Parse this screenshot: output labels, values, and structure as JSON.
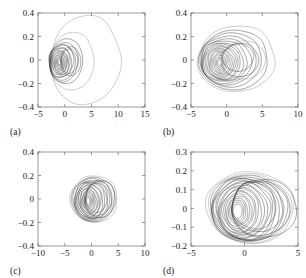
{
  "figure": {
    "type": "multi-panel-phase-portrait",
    "panels": 4,
    "layout": "2x2",
    "background_color": "#ffffff",
    "line_color": "#2b2b2b",
    "axis_color": "#6e6e6e"
  },
  "panels": {
    "a": {
      "label": "(a)",
      "xticklabels": [
        "-5",
        "0",
        "5",
        "10",
        "15"
      ],
      "yticklabels": [
        "0.4",
        "0.2",
        "0",
        "-0.2",
        "-0.4"
      ]
    },
    "b": {
      "label": "(b)",
      "xticklabels": [
        "-5",
        "0",
        "5",
        "10"
      ],
      "yticklabels": [
        "0.4",
        "0.2",
        "0",
        "-0.2",
        "-0.4"
      ]
    },
    "c": {
      "label": "(c)",
      "xticklabels": [
        "-10",
        "-5",
        "0",
        "5",
        "10"
      ],
      "yticklabels": [
        "0.4",
        "0.2",
        "0",
        "-0.2",
        "-0.4"
      ]
    },
    "d": {
      "label": "(d)",
      "xticklabels": [
        "-5",
        "0",
        "5"
      ],
      "yticklabels": [
        "0.3",
        "0.2",
        "0.1",
        "0",
        "-0.1",
        "-0.2"
      ]
    }
  },
  "chart_data": [
    {
      "panel": "a",
      "type": "line",
      "title": "",
      "xlabel": "",
      "ylabel": "",
      "xlim": [
        -5,
        15
      ],
      "ylim": [
        -0.4,
        0.4
      ],
      "xticks": [
        -5,
        0,
        5,
        10,
        15
      ],
      "yticks": [
        -0.4,
        -0.2,
        0,
        0.2,
        0.4
      ],
      "grid": false,
      "legend": "none",
      "description": "Nested quasi-periodic closed orbits; one large outer loop extends to x = 10.4 and y from -0.38 to 0.37, with a dense cluster of smaller loops centred near x = -0.6.",
      "orbits": [
        {
          "cx": 3.9,
          "cy": 0.0,
          "rx": 6.5,
          "ry": 0.375,
          "rot": 0,
          "shape": "ellipse",
          "style": "faint"
        },
        {
          "cx": 1.4,
          "cy": -0.01,
          "rx": 4.1,
          "ry": 0.245,
          "rot": 0,
          "shape": "ellipse",
          "style": "faint"
        },
        {
          "cx": 0.3,
          "cy": -0.01,
          "rx": 3.1,
          "ry": 0.19,
          "rot": 0,
          "shape": "ellipse",
          "style": "normal"
        },
        {
          "cx": -0.2,
          "cy": -0.02,
          "rx": 2.7,
          "ry": 0.168,
          "rot": -3,
          "shape": "ellipse",
          "style": "normal"
        },
        {
          "cx": -0.5,
          "cy": -0.02,
          "rx": 2.45,
          "ry": 0.152,
          "rot": 4,
          "shape": "ellipse",
          "style": "normal"
        },
        {
          "cx": -0.6,
          "cy": -0.01,
          "rx": 2.2,
          "ry": 0.143,
          "rot": -6,
          "shape": "ellipse",
          "style": "normal"
        },
        {
          "cx": -0.75,
          "cy": -0.02,
          "rx": 2.0,
          "ry": 0.132,
          "rot": 2,
          "shape": "ellipse",
          "style": "normal"
        },
        {
          "cx": -0.8,
          "cy": -0.015,
          "rx": 1.8,
          "ry": 0.12,
          "rot": -4,
          "shape": "ellipse",
          "style": "normal"
        },
        {
          "cx": -0.85,
          "cy": -0.02,
          "rx": 1.6,
          "ry": 0.108,
          "rot": 5,
          "shape": "ellipse",
          "style": "normal"
        },
        {
          "cx": -0.9,
          "cy": -0.02,
          "rx": 1.42,
          "ry": 0.097,
          "rot": -2,
          "shape": "ellipse",
          "style": "normal"
        },
        {
          "cx": -0.9,
          "cy": -0.02,
          "rx": 1.25,
          "ry": 0.086,
          "rot": 3,
          "shape": "ellipse",
          "style": "normal"
        },
        {
          "cx": -0.92,
          "cy": -0.02,
          "rx": 1.08,
          "ry": 0.075,
          "rot": -5,
          "shape": "ellipse",
          "style": "normal"
        },
        {
          "cx": -0.95,
          "cy": -0.02,
          "rx": 0.9,
          "ry": 0.064,
          "rot": 1,
          "shape": "ellipse",
          "style": "normal"
        },
        {
          "cx": -0.95,
          "cy": -0.02,
          "rx": 0.72,
          "ry": 0.053,
          "rot": -3,
          "shape": "ellipse",
          "style": "normal"
        },
        {
          "cx": -0.96,
          "cy": -0.02,
          "rx": 0.56,
          "ry": 0.042,
          "rot": 4,
          "shape": "ellipse",
          "style": "normal"
        },
        {
          "cx": -0.97,
          "cy": -0.02,
          "rx": 0.4,
          "ry": 0.031,
          "rot": 0,
          "shape": "ellipse",
          "style": "normal"
        },
        {
          "cx": -0.97,
          "cy": -0.02,
          "rx": 0.26,
          "ry": 0.021,
          "rot": 0,
          "shape": "ellipse",
          "style": "normal"
        },
        {
          "cx": 0.9,
          "cy": -0.01,
          "rx": 1.55,
          "ry": 0.1,
          "rot": 0,
          "shape": "ellipse",
          "style": "normal"
        },
        {
          "cx": 1.1,
          "cy": -0.01,
          "rx": 1.9,
          "ry": 0.12,
          "rot": 0,
          "shape": "ellipse",
          "style": "normal"
        }
      ]
    },
    {
      "panel": "b",
      "type": "line",
      "title": "",
      "xlabel": "",
      "ylabel": "",
      "xlim": [
        -5,
        10
      ],
      "ylim": [
        -0.4,
        0.4
      ],
      "xticks": [
        -5,
        0,
        5,
        10
      ],
      "yticks": [
        -0.4,
        -0.2,
        0,
        0.2,
        0.4
      ],
      "grid": false,
      "legend": "none",
      "description": "Family of nested oval orbits spanning x from -4.0 to 6.8 and y from -0.26 to 0.29, densest near x = -0.8.",
      "orbits": [
        {
          "cx": 1.4,
          "cy": 0.01,
          "rx": 5.4,
          "ry": 0.285,
          "rot": 2,
          "shape": "ellipse",
          "style": "faint"
        },
        {
          "cx": 1.0,
          "cy": 0.0,
          "rx": 4.8,
          "ry": 0.26,
          "rot": -2,
          "shape": "ellipse",
          "style": "normal"
        },
        {
          "cx": 0.6,
          "cy": 0.0,
          "rx": 4.3,
          "ry": 0.235,
          "rot": 3,
          "shape": "ellipse",
          "style": "normal"
        },
        {
          "cx": 0.2,
          "cy": -0.005,
          "rx": 3.85,
          "ry": 0.215,
          "rot": -4,
          "shape": "ellipse",
          "style": "normal"
        },
        {
          "cx": -0.1,
          "cy": -0.01,
          "rx": 3.5,
          "ry": 0.197,
          "rot": 5,
          "shape": "ellipse",
          "style": "normal"
        },
        {
          "cx": -0.35,
          "cy": -0.01,
          "rx": 3.15,
          "ry": 0.182,
          "rot": -3,
          "shape": "ellipse",
          "style": "normal"
        },
        {
          "cx": -0.5,
          "cy": -0.015,
          "rx": 2.85,
          "ry": 0.168,
          "rot": 4,
          "shape": "ellipse",
          "style": "normal"
        },
        {
          "cx": -0.62,
          "cy": -0.015,
          "rx": 2.55,
          "ry": 0.155,
          "rot": -5,
          "shape": "ellipse",
          "style": "normal"
        },
        {
          "cx": -0.7,
          "cy": -0.02,
          "rx": 2.3,
          "ry": 0.143,
          "rot": 2,
          "shape": "ellipse",
          "style": "normal"
        },
        {
          "cx": -0.78,
          "cy": -0.02,
          "rx": 2.05,
          "ry": 0.131,
          "rot": -6,
          "shape": "ellipse",
          "style": "normal"
        },
        {
          "cx": -0.82,
          "cy": -0.02,
          "rx": 1.8,
          "ry": 0.119,
          "rot": 6,
          "shape": "ellipse",
          "style": "normal"
        },
        {
          "cx": -0.85,
          "cy": -0.02,
          "rx": 1.58,
          "ry": 0.107,
          "rot": -2,
          "shape": "ellipse",
          "style": "normal"
        },
        {
          "cx": -0.88,
          "cy": -0.02,
          "rx": 1.35,
          "ry": 0.095,
          "rot": 3,
          "shape": "ellipse",
          "style": "normal"
        },
        {
          "cx": -0.9,
          "cy": -0.02,
          "rx": 1.12,
          "ry": 0.082,
          "rot": -4,
          "shape": "ellipse",
          "style": "normal"
        },
        {
          "cx": -0.92,
          "cy": -0.02,
          "rx": 0.9,
          "ry": 0.068,
          "rot": 2,
          "shape": "ellipse",
          "style": "normal"
        },
        {
          "cx": -0.93,
          "cy": -0.02,
          "rx": 0.7,
          "ry": 0.055,
          "rot": 0,
          "shape": "ellipse",
          "style": "normal"
        },
        {
          "cx": -0.94,
          "cy": -0.02,
          "rx": 0.5,
          "ry": 0.04,
          "rot": 0,
          "shape": "ellipse",
          "style": "normal"
        },
        {
          "cx": -0.95,
          "cy": -0.02,
          "rx": 0.32,
          "ry": 0.027,
          "rot": 0,
          "shape": "ellipse",
          "style": "normal"
        },
        {
          "cx": 1.9,
          "cy": 0.0,
          "rx": 2.6,
          "ry": 0.14,
          "rot": 0,
          "shape": "ellipse",
          "style": "normal"
        },
        {
          "cx": 2.3,
          "cy": 0.0,
          "rx": 3.2,
          "ry": 0.16,
          "rot": 0,
          "shape": "ellipse",
          "style": "faint"
        },
        {
          "cx": 1.6,
          "cy": 0.02,
          "rx": 2.2,
          "ry": 0.115,
          "rot": 0,
          "shape": "ellipse",
          "style": "normal"
        }
      ]
    },
    {
      "panel": "c",
      "type": "line",
      "title": "",
      "xlabel": "",
      "ylabel": "",
      "xlim": [
        -10,
        10
      ],
      "ylim": [
        -0.4,
        0.4
      ],
      "xticks": [
        -10,
        -5,
        0,
        5,
        10
      ],
      "yticks": [
        -0.4,
        -0.2,
        0,
        0.2,
        0.4
      ],
      "grid": false,
      "legend": "none",
      "description": "Compact cluster of nested orbits spanning x from -4.2 to 5.0 and y from -0.22 to 0.21, concentrated about x = 0.",
      "orbits": [
        {
          "cx": 0.5,
          "cy": 0.0,
          "rx": 4.4,
          "ry": 0.205,
          "rot": 2,
          "shape": "ellipse",
          "style": "faint"
        },
        {
          "cx": 0.35,
          "cy": -0.005,
          "rx": 4.0,
          "ry": 0.195,
          "rot": -3,
          "shape": "ellipse",
          "style": "normal"
        },
        {
          "cx": 0.2,
          "cy": -0.005,
          "rx": 3.65,
          "ry": 0.185,
          "rot": 4,
          "shape": "ellipse",
          "style": "normal"
        },
        {
          "cx": 0.05,
          "cy": -0.01,
          "rx": 3.3,
          "ry": 0.175,
          "rot": -5,
          "shape": "ellipse",
          "style": "normal"
        },
        {
          "cx": -0.1,
          "cy": -0.01,
          "rx": 3.0,
          "ry": 0.166,
          "rot": 5,
          "shape": "ellipse",
          "style": "normal"
        },
        {
          "cx": -0.2,
          "cy": -0.012,
          "rx": 2.72,
          "ry": 0.157,
          "rot": -4,
          "shape": "ellipse",
          "style": "normal"
        },
        {
          "cx": -0.3,
          "cy": -0.014,
          "rx": 2.45,
          "ry": 0.147,
          "rot": 3,
          "shape": "ellipse",
          "style": "normal"
        },
        {
          "cx": -0.38,
          "cy": -0.015,
          "rx": 2.2,
          "ry": 0.137,
          "rot": -6,
          "shape": "ellipse",
          "style": "normal"
        },
        {
          "cx": -0.45,
          "cy": -0.016,
          "rx": 1.96,
          "ry": 0.127,
          "rot": 6,
          "shape": "ellipse",
          "style": "normal"
        },
        {
          "cx": -0.5,
          "cy": -0.017,
          "rx": 1.74,
          "ry": 0.116,
          "rot": -2,
          "shape": "ellipse",
          "style": "normal"
        },
        {
          "cx": -0.55,
          "cy": -0.018,
          "rx": 1.52,
          "ry": 0.105,
          "rot": 4,
          "shape": "ellipse",
          "style": "normal"
        },
        {
          "cx": -0.58,
          "cy": -0.018,
          "rx": 1.3,
          "ry": 0.094,
          "rot": -3,
          "shape": "ellipse",
          "style": "normal"
        },
        {
          "cx": -0.6,
          "cy": -0.018,
          "rx": 1.1,
          "ry": 0.082,
          "rot": 2,
          "shape": "ellipse",
          "style": "normal"
        },
        {
          "cx": -0.62,
          "cy": -0.018,
          "rx": 0.9,
          "ry": 0.07,
          "rot": -4,
          "shape": "ellipse",
          "style": "normal"
        },
        {
          "cx": -0.63,
          "cy": -0.018,
          "rx": 0.7,
          "ry": 0.057,
          "rot": 0,
          "shape": "ellipse",
          "style": "normal"
        },
        {
          "cx": -0.64,
          "cy": -0.018,
          "rx": 0.52,
          "ry": 0.044,
          "rot": 0,
          "shape": "ellipse",
          "style": "normal"
        },
        {
          "cx": -0.65,
          "cy": -0.018,
          "rx": 0.35,
          "ry": 0.03,
          "rot": 0,
          "shape": "ellipse",
          "style": "normal"
        },
        {
          "cx": 1.3,
          "cy": 0.005,
          "rx": 2.4,
          "ry": 0.145,
          "rot": 0,
          "shape": "ellipse",
          "style": "normal"
        },
        {
          "cx": 1.6,
          "cy": 0.0,
          "rx": 2.9,
          "ry": 0.16,
          "rot": 0,
          "shape": "ellipse",
          "style": "normal"
        },
        {
          "cx": 1.0,
          "cy": 0.01,
          "rx": 2.0,
          "ry": 0.125,
          "rot": 0,
          "shape": "ellipse",
          "style": "normal"
        }
      ]
    },
    {
      "panel": "d",
      "type": "line",
      "title": "",
      "xlabel": "",
      "ylabel": "",
      "xlim": [
        -5,
        5
      ],
      "ylim": [
        -0.2,
        0.3
      ],
      "xticks": [
        -5,
        0,
        5
      ],
      "yticks": [
        -0.2,
        -0.1,
        0,
        0.1,
        0.2,
        0.3
      ],
      "grid": false,
      "legend": "none",
      "description": "Densest orbit family; many overlapping loops spanning x from -3.6 to 4.7 and y from -0.19 to 0.20, with strong braiding near the centre.",
      "orbits": [
        {
          "cx": 0.55,
          "cy": 0.005,
          "rx": 4.1,
          "ry": 0.195,
          "rot": 2,
          "shape": "ellipse",
          "style": "faint"
        },
        {
          "cx": 0.45,
          "cy": 0.0,
          "rx": 3.85,
          "ry": 0.188,
          "rot": -2,
          "shape": "ellipse",
          "style": "faint"
        },
        {
          "cx": 0.35,
          "cy": 0.0,
          "rx": 3.6,
          "ry": 0.18,
          "rot": 3,
          "shape": "ellipse",
          "style": "normal"
        },
        {
          "cx": 0.25,
          "cy": -0.002,
          "rx": 3.38,
          "ry": 0.173,
          "rot": -4,
          "shape": "ellipse",
          "style": "normal"
        },
        {
          "cx": 0.15,
          "cy": -0.004,
          "rx": 3.15,
          "ry": 0.166,
          "rot": 5,
          "shape": "ellipse",
          "style": "normal"
        },
        {
          "cx": 0.05,
          "cy": -0.006,
          "rx": 2.95,
          "ry": 0.159,
          "rot": -5,
          "shape": "ellipse",
          "style": "normal"
        },
        {
          "cx": -0.05,
          "cy": -0.008,
          "rx": 2.75,
          "ry": 0.152,
          "rot": 4,
          "shape": "ellipse",
          "style": "normal"
        },
        {
          "cx": -0.14,
          "cy": -0.009,
          "rx": 2.55,
          "ry": 0.145,
          "rot": -6,
          "shape": "ellipse",
          "style": "normal"
        },
        {
          "cx": -0.22,
          "cy": -0.01,
          "rx": 2.36,
          "ry": 0.138,
          "rot": 6,
          "shape": "ellipse",
          "style": "normal"
        },
        {
          "cx": -0.3,
          "cy": -0.011,
          "rx": 2.16,
          "ry": 0.131,
          "rot": -3,
          "shape": "ellipse",
          "style": "normal"
        },
        {
          "cx": -0.36,
          "cy": -0.012,
          "rx": 1.97,
          "ry": 0.123,
          "rot": 3,
          "shape": "ellipse",
          "style": "normal"
        },
        {
          "cx": -0.42,
          "cy": -0.013,
          "rx": 1.78,
          "ry": 0.115,
          "rot": -5,
          "shape": "ellipse",
          "style": "normal"
        },
        {
          "cx": -0.47,
          "cy": -0.014,
          "rx": 1.6,
          "ry": 0.107,
          "rot": 5,
          "shape": "ellipse",
          "style": "normal"
        },
        {
          "cx": -0.51,
          "cy": -0.014,
          "rx": 1.42,
          "ry": 0.099,
          "rot": -2,
          "shape": "ellipse",
          "style": "normal"
        },
        {
          "cx": -0.55,
          "cy": -0.015,
          "rx": 1.24,
          "ry": 0.09,
          "rot": 2,
          "shape": "ellipse",
          "style": "normal"
        },
        {
          "cx": -0.58,
          "cy": -0.015,
          "rx": 1.07,
          "ry": 0.081,
          "rot": -4,
          "shape": "ellipse",
          "style": "normal"
        },
        {
          "cx": -0.6,
          "cy": -0.015,
          "rx": 0.9,
          "ry": 0.071,
          "rot": 4,
          "shape": "ellipse",
          "style": "normal"
        },
        {
          "cx": -0.62,
          "cy": -0.015,
          "rx": 0.74,
          "ry": 0.061,
          "rot": 0,
          "shape": "ellipse",
          "style": "normal"
        },
        {
          "cx": -0.63,
          "cy": -0.015,
          "rx": 0.58,
          "ry": 0.05,
          "rot": 0,
          "shape": "ellipse",
          "style": "normal"
        },
        {
          "cx": -0.64,
          "cy": -0.015,
          "rx": 0.43,
          "ry": 0.039,
          "rot": 0,
          "shape": "ellipse",
          "style": "normal"
        },
        {
          "cx": 1.5,
          "cy": 0.0,
          "rx": 2.7,
          "ry": 0.15,
          "rot": 0,
          "shape": "ellipse",
          "style": "normal"
        },
        {
          "cx": 1.8,
          "cy": 0.0,
          "rx": 3.0,
          "ry": 0.162,
          "rot": 0,
          "shape": "ellipse",
          "style": "normal"
        },
        {
          "cx": 1.2,
          "cy": 0.01,
          "rx": 2.35,
          "ry": 0.14,
          "rot": 0,
          "shape": "ellipse",
          "style": "normal"
        },
        {
          "cx": 0.9,
          "cy": 0.015,
          "rx": 2.0,
          "ry": 0.128,
          "rot": 0,
          "shape": "ellipse",
          "style": "normal"
        }
      ]
    }
  ]
}
